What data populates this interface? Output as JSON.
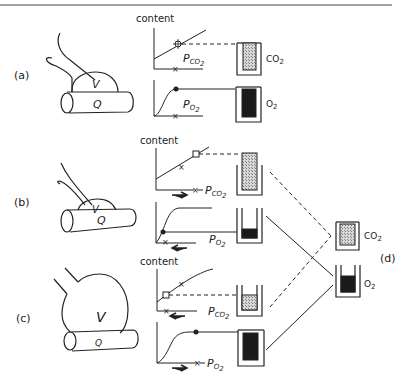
{
  "figure": {
    "panels": [
      {
        "id": "a",
        "label": "(a)",
        "alveolus_label": "V",
        "capillary_label": "Q",
        "co2_graph": {
          "y_label": "content",
          "x_label": "P",
          "x_sub": "CO2",
          "marker": "open-star",
          "shift_arrow": "none"
        },
        "o2_graph": {
          "x_label": "P",
          "x_sub": "O2",
          "marker": "filled-dot",
          "shift_arrow": "none"
        },
        "co2_container": {
          "label": "CO",
          "sub": "2",
          "fill_level": "high"
        },
        "o2_container": {
          "label": "O",
          "sub": "2",
          "fill_level": "high"
        }
      },
      {
        "id": "b",
        "label": "(b)",
        "alveolus_label": "V",
        "capillary_label": "Q",
        "co2_graph": {
          "y_label": "content",
          "x_label": "P",
          "x_sub": "CO2",
          "marker": "open-square",
          "shift_arrow": "right"
        },
        "o2_graph": {
          "x_label": "P",
          "x_sub": "O2",
          "marker": "filled-dot",
          "shift_arrow": "left"
        },
        "co2_container": {
          "label": "",
          "sub": "",
          "fill_level": "overflow"
        },
        "o2_container": {
          "label": "",
          "sub": "",
          "fill_level": "low"
        }
      },
      {
        "id": "c",
        "label": "(c)",
        "alveolus_label": "V",
        "capillary_label": "Q",
        "co2_graph": {
          "y_label": "content",
          "x_label": "P",
          "x_sub": "CO2",
          "marker": "open-square",
          "shift_arrow": "left"
        },
        "o2_graph": {
          "x_label": "P",
          "x_sub": "O2",
          "marker": "filled-dot",
          "shift_arrow": "right"
        },
        "co2_container": {
          "label": "",
          "sub": "",
          "fill_level": "low"
        },
        "o2_container": {
          "label": "",
          "sub": "",
          "fill_level": "high"
        }
      }
    ],
    "mixed": {
      "label": "(d)",
      "co2_container": {
        "label": "CO",
        "sub": "2",
        "fill_level": "high"
      },
      "o2_container": {
        "label": "O",
        "sub": "2",
        "fill_level": "medium"
      }
    },
    "colors": {
      "ink": "#222222",
      "dark_fill": "#1a1a1a",
      "hatch": "#9a9a9a",
      "background": "#ffffff"
    }
  }
}
